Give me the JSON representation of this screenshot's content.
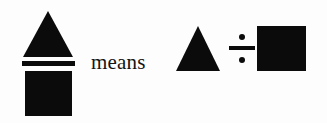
{
  "figure": {
    "kind": "shape-notation-definition",
    "background_color": "#fdfdfd",
    "ink_color": "#0b0b0b",
    "connective_word": "means",
    "left_expression": {
      "type": "fraction",
      "numerator": {
        "shape": "triangle",
        "icon": "triangle-icon",
        "fill": "#0b0b0b"
      },
      "denominator": {
        "shape": "square",
        "icon": "square-icon",
        "fill": "#0b0b0b"
      },
      "bar": {
        "icon": "fraction-bar-icon",
        "fill": "#0b0b0b"
      }
    },
    "right_expression": {
      "type": "division",
      "dividend": {
        "shape": "triangle",
        "icon": "triangle-icon",
        "fill": "#0b0b0b"
      },
      "operator": {
        "symbol": "÷",
        "icon": "division-sign-icon"
      },
      "divisor": {
        "shape": "square",
        "icon": "square-icon",
        "fill": "#0b0b0b"
      }
    }
  }
}
